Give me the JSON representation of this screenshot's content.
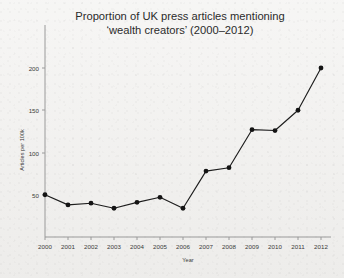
{
  "chart_data": {
    "type": "line",
    "title": "Proportion of UK press articles mentioning ‘wealth creators’ (2000–2012)",
    "title_line1": "Proportion of UK press articles mentioning",
    "title_line2": "‘wealth creators’ (2000–2012)",
    "xlabel": "Year",
    "ylabel": "Articles per 100k",
    "categories": [
      "2000",
      "2001",
      "2002",
      "2003",
      "2004",
      "2005",
      "2006",
      "2007",
      "2008",
      "2009",
      "2010",
      "2011",
      "2012"
    ],
    "x": [
      2000,
      2001,
      2002,
      2003,
      2004,
      2005,
      2006,
      2007,
      2008,
      2009,
      2010,
      2011,
      2012
    ],
    "values": [
      50,
      38,
      40,
      34,
      41,
      47,
      34,
      78,
      82,
      127,
      126,
      150,
      200
    ],
    "series": [
      {
        "name": "Articles per 100k",
        "values": [
          50,
          38,
          40,
          34,
          41,
          47,
          34,
          78,
          82,
          127,
          126,
          150,
          200
        ]
      }
    ],
    "ylim": [
      0,
      220
    ],
    "xlim": [
      2000,
      2012
    ],
    "yticks": [
      50,
      100,
      150,
      200
    ],
    "ytick_labels": [
      "50",
      "100",
      "150",
      "200"
    ],
    "xticks": [
      2000,
      2001,
      2002,
      2003,
      2004,
      2005,
      2006,
      2007,
      2008,
      2009,
      2010,
      2011,
      2012
    ],
    "xtick_labels": [
      "2000",
      "2001",
      "2002",
      "2003",
      "2004",
      "2005",
      "2006",
      "2007",
      "2008",
      "2009",
      "2010",
      "2011",
      "2012"
    ],
    "grid": false,
    "legend": "none",
    "marker": "circle",
    "line_color": "#1d1d1d",
    "marker_color": "#141414",
    "axis_color": "#9a9a9a",
    "background_color": "#f2f1ef",
    "text_color": "#2b2b2b"
  }
}
